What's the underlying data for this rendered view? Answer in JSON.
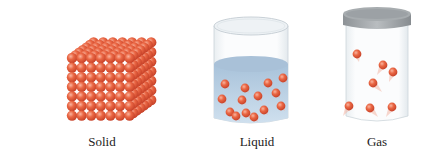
{
  "diagram": {
    "panels": [
      {
        "id": "solid",
        "label": "Solid"
      },
      {
        "id": "liquid",
        "label": "Liquid"
      },
      {
        "id": "gas",
        "label": "Gas"
      }
    ]
  },
  "colors": {
    "particle": "#e5573a",
    "particle_highlight": "#f7a08a",
    "liquid": "#bcd3e6",
    "glass": "#dfe6ea",
    "lid": "#9a9fa3"
  }
}
